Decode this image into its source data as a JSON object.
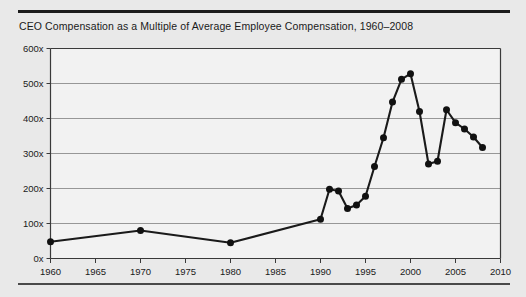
{
  "figure": {
    "title": "CEO Compensation as a Multiple of Average Employee Compensation, 1960–2008",
    "background_color": "#e9e9e9",
    "rule_color": "#1c1c1c"
  },
  "chart_data": {
    "type": "line",
    "title": "CEO Compensation as a Multiple of Average Employee Compensation, 1960–2008",
    "xlabel": "",
    "ylabel": "",
    "xlim": [
      1960,
      2010
    ],
    "ylim": [
      0,
      600
    ],
    "grid": true,
    "grid_axis": "y",
    "legend": false,
    "line_color": "#1a1a1a",
    "marker": "circle",
    "marker_color": "#111111",
    "x_ticks": [
      1960,
      1965,
      1970,
      1975,
      1980,
      1985,
      1990,
      1995,
      2000,
      2005,
      2010
    ],
    "x_tick_labels": [
      "1960",
      "1965",
      "1970",
      "1975",
      "1980",
      "1985",
      "1990",
      "1995",
      "2000",
      "2005",
      "2010"
    ],
    "y_ticks": [
      0,
      100,
      200,
      300,
      400,
      500,
      600
    ],
    "y_tick_labels": [
      "0x",
      "100x",
      "200x",
      "300x",
      "400x",
      "500x",
      "600x"
    ],
    "series": [
      {
        "name": "CEO pay multiple",
        "x": [
          1960,
          1970,
          1980,
          1990,
          1991,
          1992,
          1993,
          1994,
          1995,
          1996,
          1997,
          1998,
          1999,
          2000,
          2001,
          2002,
          2003,
          2004,
          2005,
          2006,
          2007,
          2008
        ],
        "values": [
          48,
          80,
          45,
          112,
          198,
          193,
          143,
          153,
          178,
          263,
          345,
          447,
          512,
          528,
          420,
          270,
          278,
          425,
          388,
          370,
          347,
          317
        ]
      }
    ]
  }
}
